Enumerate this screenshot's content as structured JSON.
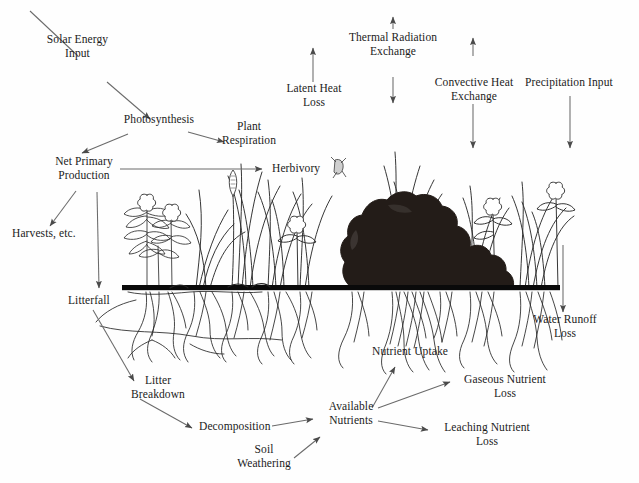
{
  "diagram": {
    "background_color": "#fefefe",
    "ink_color": "#1b1b1b",
    "arrow_color": "#5a5a5a",
    "ground_line_color": "#000000",
    "rock_fill_color": "#231c18",
    "labels": {
      "solar_energy_input": "Solar Energy\nInput",
      "photosynthesis": "Photosynthesis",
      "plant_respiration": "Plant\nRespiration",
      "net_primary_production": "Net Primary\nProduction",
      "harvests": "Harvests, etc.",
      "herbivory": "Herbivory",
      "litterfall": "Litterfall",
      "latent_heat_loss": "Latent Heat\nLoss",
      "thermal_radiation_exchange": "Thermal Radiation\nExchange",
      "convective_heat_exchange": "Convective Heat\nExchange",
      "precipitation_input": "Precipitation Input",
      "water_runoff_loss": "Water Runoff\nLoss",
      "nutrient_uptake": "Nutrient Uptake",
      "litter_breakdown": "Litter\nBreakdown",
      "decomposition": "Decomposition",
      "soil_weathering": "Soil\nWeathering",
      "available_nutrients": "Available\nNutrients",
      "gaseous_nutrient_loss": "Gaseous Nutrient\nLoss",
      "leaching_nutrient_loss": "Leaching Nutrient\nLoss"
    },
    "flows": [
      {
        "from": "solar_energy_input",
        "to": "photosynthesis",
        "style": "single-arrow"
      },
      {
        "from": "photosynthesis",
        "to": "net_primary_production",
        "style": "single-arrow"
      },
      {
        "from": "photosynthesis",
        "to": "plant_respiration",
        "style": "single-arrow"
      },
      {
        "from": "net_primary_production",
        "to": "harvests",
        "style": "single-arrow"
      },
      {
        "from": "net_primary_production",
        "to": "litterfall",
        "style": "single-arrow"
      },
      {
        "from": "net_primary_production",
        "to": "herbivory",
        "style": "single-arrow"
      },
      {
        "from": "litterfall",
        "to": "litter_breakdown",
        "style": "single-arrow"
      },
      {
        "from": "litter_breakdown",
        "to": "decomposition",
        "style": "single-arrow"
      },
      {
        "from": "decomposition",
        "to": "available_nutrients",
        "style": "single-arrow"
      },
      {
        "from": "soil_weathering",
        "to": "available_nutrients",
        "style": "single-arrow"
      },
      {
        "from": "available_nutrients",
        "to": "nutrient_uptake",
        "style": "single-arrow"
      },
      {
        "from": "available_nutrients",
        "to": "gaseous_nutrient_loss",
        "style": "single-arrow"
      },
      {
        "from": "available_nutrients",
        "to": "leaching_nutrient_loss",
        "style": "single-arrow"
      },
      {
        "from": "ecosystem",
        "to": "latent_heat_loss",
        "style": "up-arrow"
      },
      {
        "from": "ecosystem",
        "to": "thermal_radiation_exchange",
        "style": "double-arrow"
      },
      {
        "from": "ecosystem",
        "to": "convective_heat_exchange",
        "style": "double-arrow"
      },
      {
        "from": "precipitation_input",
        "to": "ecosystem",
        "style": "down-arrow"
      },
      {
        "from": "ecosystem",
        "to": "water_runoff_loss",
        "style": "down-arrow"
      }
    ],
    "scene": {
      "ground_line_y": 288,
      "ground_line_x_start": 122,
      "ground_line_x_end": 560,
      "rock_label": "boulder",
      "vegetation": "grasses-and-flowering-herbs",
      "root_zone": "fibrous-roots-below-ground-line"
    }
  }
}
